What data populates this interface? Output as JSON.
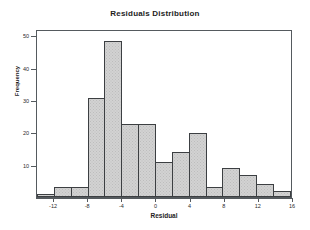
{
  "chart_data": {
    "type": "bar",
    "title": "Residuals Distribution",
    "xlabel": "Residual",
    "ylabel": "Frequency",
    "bin_width": 2,
    "bin_starts": [
      -14,
      -12,
      -10,
      -8,
      -6,
      -4,
      -2,
      0,
      2,
      4,
      6,
      8,
      10,
      12,
      14
    ],
    "categories": [
      "-14",
      "-12",
      "-10",
      "-8",
      "-6",
      "-4",
      "-2",
      "0",
      "2",
      "4",
      "6",
      "8",
      "10",
      "12",
      "14"
    ],
    "values": [
      1,
      3,
      3,
      31,
      49,
      23,
      23,
      11,
      14,
      20,
      3,
      9,
      7,
      4,
      2
    ],
    "xlim": [
      -14,
      16
    ],
    "ylim": [
      0,
      52
    ],
    "xticks": [
      -12,
      -8,
      -4,
      0,
      4,
      8,
      12,
      16
    ],
    "xtick_labels": [
      "-12",
      "-8",
      "-4",
      "0",
      "4",
      "8",
      "12",
      "16"
    ],
    "yticks": [
      10,
      20,
      30,
      40,
      50
    ],
    "ytick_labels": [
      "10",
      "20",
      "30",
      "40",
      "50"
    ],
    "grid": false,
    "legend": "none",
    "bar_fill": "#d2d2d2",
    "bar_edge": "#3c3f42",
    "plot_background": "#ffffff",
    "axis_color": "#555a5e"
  }
}
